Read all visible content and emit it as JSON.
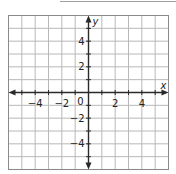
{
  "graph": {
    "x_label": "x",
    "y_label": "y",
    "x_range": [
      -6,
      6
    ],
    "y_range": [
      -6,
      6
    ],
    "grid_step": 1,
    "x_tick_labels": [
      {
        "value": -4,
        "text": "−4"
      },
      {
        "value": -2,
        "text": "−2"
      },
      {
        "value": 2,
        "text": "2"
      },
      {
        "value": 4,
        "text": "4"
      }
    ],
    "y_tick_labels": [
      {
        "value": 4,
        "text": "4"
      },
      {
        "value": 2,
        "text": "2"
      },
      {
        "value": -2,
        "text": "−2"
      },
      {
        "value": -4,
        "text": "−4"
      }
    ],
    "origin_label": "0",
    "colors": {
      "grid": "#b8b8b8",
      "border": "#8a8a8a",
      "axis": "#2a2a2a",
      "top_rule": "#a0a0a0"
    }
  }
}
